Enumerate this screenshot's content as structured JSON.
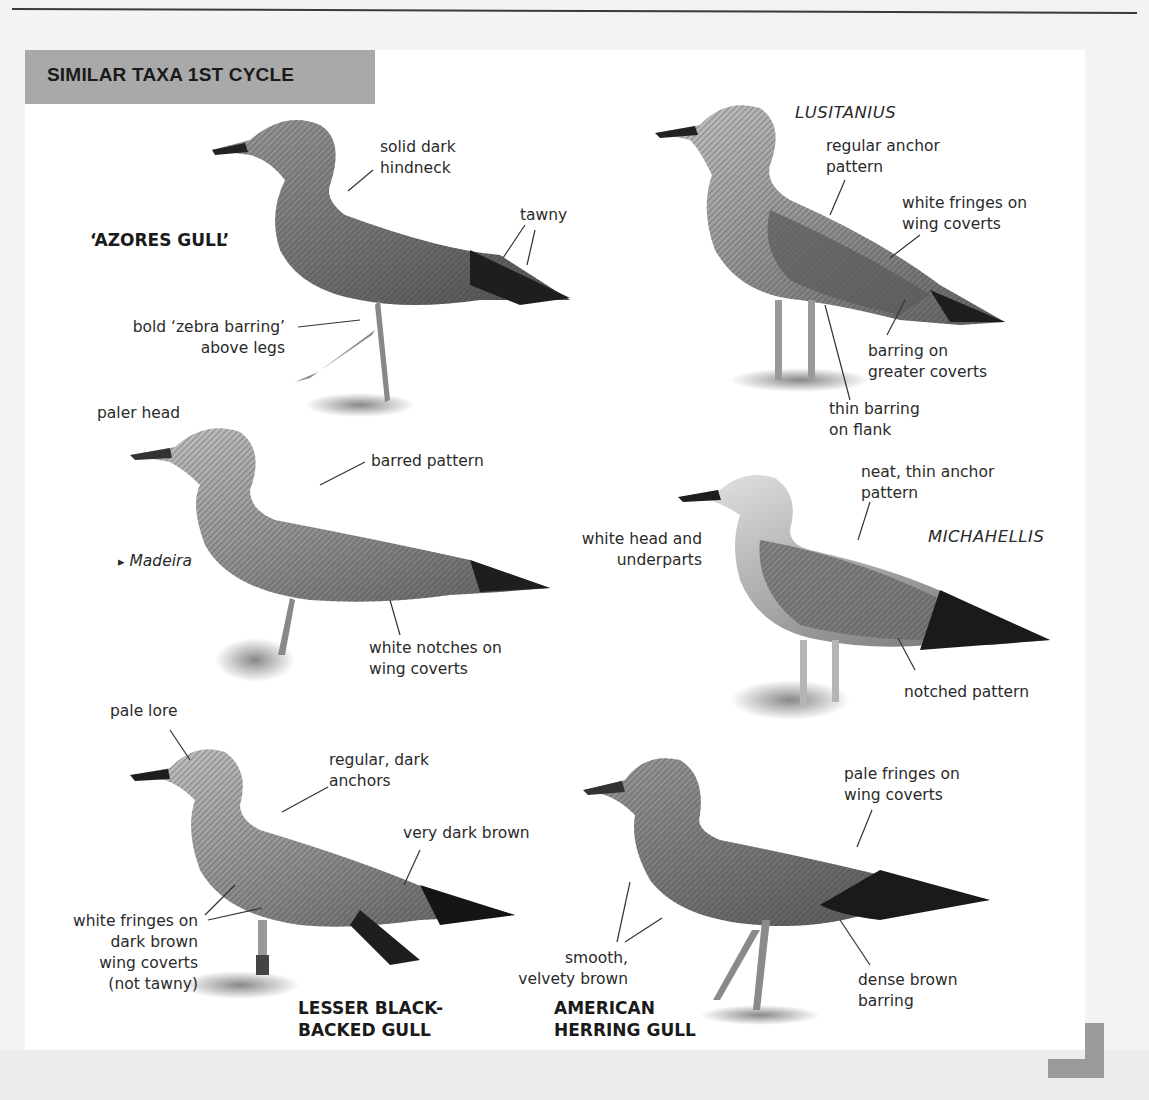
{
  "page": {
    "section_title": "SIMILAR TAXA 1ST CYCLE",
    "colors": {
      "header_band": "#a9a9a9",
      "panel": "#ffffff",
      "page": "#f3f3f3",
      "corner_mark": "#9a9a9a"
    }
  },
  "birds": {
    "azores": {
      "species_label": "‘AZORES GULL’",
      "annotations": {
        "hindneck": [
          "solid dark",
          "hindneck"
        ],
        "tawny": "tawny",
        "zebra": [
          "bold ‘zebra barring’",
          "above legs"
        ]
      }
    },
    "lusitanius": {
      "taxon_label": "LUSITANIUS",
      "annotations": {
        "anchor": [
          "regular anchor",
          "pattern"
        ],
        "fringes": [
          "white fringes on",
          "wing coverts"
        ],
        "greater_coverts": [
          "barring on",
          "greater coverts"
        ],
        "flank": [
          "thin barring",
          "on flank"
        ]
      }
    },
    "madeira": {
      "location_label": "Madeira",
      "location_icon": "▸",
      "annotations": {
        "head": "paler head",
        "barred": "barred pattern",
        "notches": [
          "white notches on",
          "wing coverts"
        ]
      }
    },
    "michahellis": {
      "taxon_label": "MICHAHELLIS",
      "annotations": {
        "anchor": [
          "neat, thin anchor",
          "pattern"
        ],
        "head": [
          "white head and",
          "underparts"
        ],
        "notched": "notched pattern"
      }
    },
    "lesser_black_backed": {
      "species_label": [
        "LESSER BLACK-",
        "BACKED GULL"
      ],
      "annotations": {
        "lore": "pale lore",
        "anchors": [
          "regular, dark",
          "anchors"
        ],
        "dark_brown": "very dark brown",
        "fringes": [
          "white fringes on",
          "dark brown",
          "wing coverts",
          "(not tawny)"
        ]
      }
    },
    "american_herring": {
      "species_label": [
        "AMERICAN",
        "HERRING GULL"
      ],
      "annotations": {
        "fringes": [
          "pale fringes on",
          "wing coverts"
        ],
        "smooth": [
          "smooth,",
          "velvety brown"
        ],
        "barring": [
          "dense brown",
          "barring"
        ]
      }
    }
  }
}
